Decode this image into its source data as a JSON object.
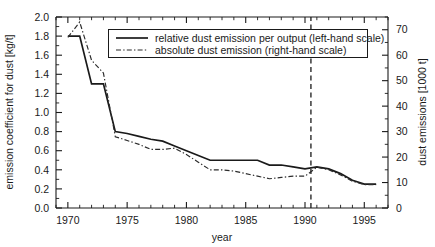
{
  "chart_data": {
    "type": "line",
    "title": "",
    "xlabel": "year",
    "ylabel": "emission coefficient for dust [kg/t]",
    "y2label": "dust emissions [1000 t]",
    "xlim": [
      1969,
      1997
    ],
    "ylim": [
      0.0,
      2.0
    ],
    "y2lim": [
      0,
      75
    ],
    "grid": false,
    "legend_position": "top-center",
    "x_ticks_major": [
      1970,
      1975,
      1980,
      1985,
      1990,
      1995
    ],
    "x_ticks_minor_step": 1,
    "y_ticks_major": [
      "0.0",
      "0.2",
      "0.4",
      "0.6",
      "0.8",
      "1.0",
      "1.2",
      "1.4",
      "1.6",
      "1.8",
      "2.0"
    ],
    "y2_ticks_major": [
      "0",
      "10",
      "20",
      "30",
      "40",
      "50",
      "60",
      "70"
    ],
    "annotations": [
      {
        "name": "reunification-marker",
        "type": "vline",
        "x": 1990.5,
        "style": "dashed",
        "label": ""
      }
    ],
    "series": [
      {
        "name": "relative dust emission per output (left-hand scale)",
        "axis": "left",
        "style": "solid",
        "x": [
          1970,
          1971,
          1972,
          1973,
          1974,
          1975,
          1976,
          1977,
          1978,
          1979,
          1980,
          1981,
          1982,
          1983,
          1984,
          1985,
          1986,
          1987,
          1988,
          1989,
          1990,
          1991,
          1992,
          1993,
          1994,
          1995,
          1996
        ],
        "values": [
          1.8,
          1.8,
          1.3,
          1.3,
          0.8,
          0.78,
          0.75,
          0.72,
          0.7,
          0.65,
          0.6,
          0.55,
          0.5,
          0.5,
          0.5,
          0.5,
          0.5,
          0.45,
          0.45,
          0.43,
          0.41,
          0.43,
          0.41,
          0.36,
          0.29,
          0.25,
          0.25
        ]
      },
      {
        "name": "absolute dust emission (right-hand scale)",
        "axis": "right",
        "style": "dash-dot",
        "x": [
          1970,
          1971,
          1972,
          1973,
          1974,
          1975,
          1976,
          1977,
          1978,
          1979,
          1980,
          1981,
          1982,
          1983,
          1984,
          1985,
          1986,
          1987,
          1988,
          1989,
          1990,
          1991,
          1992,
          1993,
          1994,
          1995,
          1996
        ],
        "values": [
          67.0,
          73.0,
          58.0,
          53.0,
          28.0,
          26.5,
          25.0,
          23.0,
          23.0,
          23.5,
          21.0,
          18.0,
          15.0,
          15.0,
          14.5,
          13.5,
          12.5,
          11.5,
          12.0,
          12.5,
          12.5,
          16.0,
          15.0,
          13.0,
          10.5,
          9.2,
          9.2
        ]
      }
    ]
  },
  "legend": {
    "entries": [
      {
        "label": "relative dust emission per output (left-hand scale)",
        "style": "solid"
      },
      {
        "label": "absolute dust emission (right-hand scale)",
        "style": "dash-dot"
      }
    ]
  }
}
